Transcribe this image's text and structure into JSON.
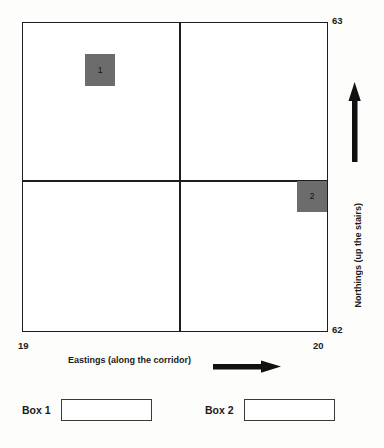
{
  "diagram": {
    "type": "coordinate-grid",
    "x_axis": {
      "title": "Eastings (along the corridor)",
      "arrow": "right-arrow-icon",
      "min_label": "19",
      "max_label": "20"
    },
    "y_axis": {
      "title": "Northings (up the stairs)",
      "arrow": "up-arrow-icon",
      "min_label": "62",
      "max_label": "63"
    },
    "grid": {
      "vertical_divisions": 2,
      "horizontal_divisions": 2
    },
    "markers": [
      {
        "label": "1",
        "quadrant": "top-left",
        "fill": "#6c6c6c"
      },
      {
        "label": "2",
        "quadrant": "bottom-right",
        "fill": "#6c6c6c"
      }
    ]
  },
  "answers": [
    {
      "label": "Box 1",
      "value": "",
      "placeholder": ""
    },
    {
      "label": "Box 2",
      "value": "",
      "placeholder": ""
    }
  ]
}
